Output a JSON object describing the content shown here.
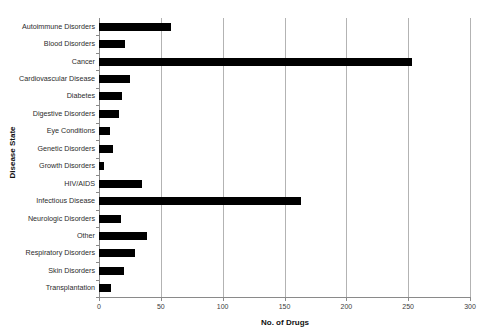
{
  "chart_data": {
    "type": "bar",
    "orientation": "horizontal",
    "title": "",
    "xlabel": "No. of Drugs",
    "ylabel": "Disease State",
    "categories": [
      "Autoimmune Disorders",
      "Blood Disorders",
      "Cancer",
      "Cardiovascular Disease",
      "Diabetes",
      "Digestive Disorders",
      "Eye Conditions",
      "Genetic Disorders",
      "Growth Disorders",
      "HIV/AIDS",
      "Infectious Disease",
      "Neurologic Disorders",
      "Other",
      "Respiratory Disorders",
      "Skin Disorders",
      "Transplantation"
    ],
    "values": [
      58,
      21,
      253,
      25,
      19,
      16,
      9,
      11,
      4,
      35,
      163,
      18,
      39,
      29,
      20,
      10
    ],
    "xlim": [
      0,
      300
    ],
    "xticks": [
      0,
      50,
      100,
      150,
      200,
      250,
      300
    ],
    "xtick_labels": [
      "0",
      "50",
      "100",
      "150",
      "200",
      "250",
      "300"
    ],
    "grid": "vertical",
    "legend": "none",
    "bar_color": "#000000",
    "grid_color": "#b3b3b3",
    "axis_color": "#8a8a8a",
    "background_color": "#ffffff"
  }
}
